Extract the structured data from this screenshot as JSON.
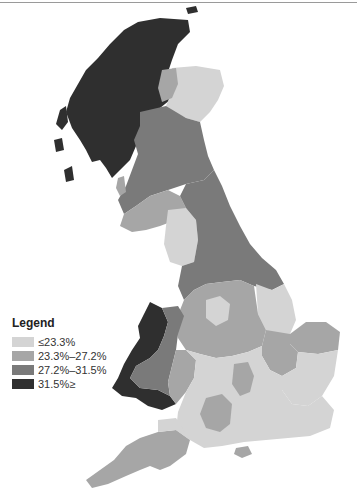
{
  "legend": {
    "title": "Legend",
    "items": [
      {
        "label": "≤23.3%",
        "color": "#d4d4d4"
      },
      {
        "label": "23.3%–27.2%",
        "color": "#a6a6a6"
      },
      {
        "label": "27.2%–31.5%",
        "color": "#7a7a7a"
      },
      {
        "label": "31.5%≥",
        "color": "#2f2f2f"
      }
    ]
  },
  "map": {
    "subject": "Great Britain choropleth by region",
    "regions_highlight": {
      "scottish_highlands": "31.5%≥",
      "wales_west": "31.5%≥",
      "north_east_scotland": "≤23.3%",
      "southern_england": "≤23.3%",
      "south_west_england": "23.3%–27.2%",
      "northern_england": "27.2%–31.5%"
    }
  }
}
